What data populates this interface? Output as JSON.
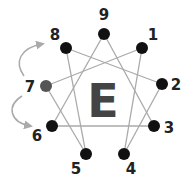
{
  "diagram": {
    "center_letter": "E",
    "highlight_node": "7",
    "colors": {
      "node": "#111111",
      "highlight": "#555555",
      "line": "#aaaaaa",
      "arrow": "#aaaaaa",
      "center": "#444444"
    },
    "nodes": [
      {
        "label": "9",
        "x": 104,
        "y": 34,
        "lx": 104,
        "ly": 20
      },
      {
        "label": "1",
        "x": 142,
        "y": 48,
        "lx": 153,
        "ly": 40
      },
      {
        "label": "2",
        "x": 162,
        "y": 84,
        "lx": 176,
        "ly": 90
      },
      {
        "label": "3",
        "x": 154,
        "y": 126,
        "lx": 169,
        "ly": 133
      },
      {
        "label": "4",
        "x": 124,
        "y": 154,
        "lx": 131,
        "ly": 174
      },
      {
        "label": "5",
        "x": 86,
        "y": 154,
        "lx": 76,
        "ly": 174
      },
      {
        "label": "6",
        "x": 52,
        "y": 126,
        "lx": 37,
        "ly": 141
      },
      {
        "label": "7",
        "x": 46,
        "y": 86,
        "lx": 30,
        "ly": 92
      },
      {
        "label": "8",
        "x": 66,
        "y": 48,
        "lx": 55,
        "ly": 40
      }
    ],
    "edges": [
      [
        "9",
        "6"
      ],
      [
        "9",
        "3"
      ],
      [
        "6",
        "3"
      ],
      [
        "1",
        "4"
      ],
      [
        "4",
        "2"
      ],
      [
        "2",
        "8"
      ],
      [
        "8",
        "5"
      ],
      [
        "5",
        "7"
      ],
      [
        "7",
        "1"
      ]
    ],
    "arrows": [
      {
        "from": "7",
        "to": "8",
        "direction": "up"
      },
      {
        "from": "7",
        "to": "6",
        "direction": "down"
      }
    ]
  }
}
